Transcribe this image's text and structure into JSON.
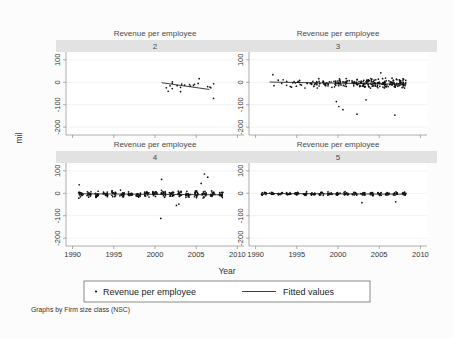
{
  "chart_data": {
    "type": "scatter",
    "title": "",
    "panel_title": "Revenue per employee",
    "xlabel": "Year",
    "ylabel": "mil",
    "note": "Graphs by Firm size class (NSC)",
    "xlim": [
      1989.2,
      2010.8
    ],
    "ylim": [
      -235,
      135
    ],
    "xticks": [
      1990,
      1995,
      2000,
      2005,
      2010
    ],
    "xticklabels": [
      "1990",
      "1995",
      "2000",
      "2005",
      "2010"
    ],
    "yticks": [
      100,
      0,
      -100,
      -200
    ],
    "yticklabels": [
      "100",
      "0",
      "-100",
      "-200"
    ],
    "grid": "horizontal",
    "legend_position": "bottom",
    "legend": [
      {
        "label": "Revenue per employee",
        "marker": "dot"
      },
      {
        "label": "Fitted values",
        "marker": "line"
      }
    ],
    "facet_variable": "Firm size class (NSC)",
    "panels": [
      {
        "id": "2",
        "strip_label": "2",
        "row": 0,
        "col": 0,
        "n_points": 19,
        "x_range": [
          2000.7,
          2007.2
        ],
        "y_center": -12,
        "y_spread": 22,
        "seed": 17,
        "fit": {
          "x0": 2000.8,
          "y0": -2,
          "x1": 2006.6,
          "y1": -32
        },
        "outliers": [
          {
            "x": 2003.1,
            "y": -42
          },
          {
            "x": 2007.1,
            "y": -72
          },
          {
            "x": 2001.6,
            "y": -40
          }
        ]
      },
      {
        "id": "3",
        "strip_label": "3",
        "row": 0,
        "col": 1,
        "n_points": 260,
        "x_range": [
          1991.6,
          2008.4
        ],
        "y_center": -4,
        "y_spread": 19,
        "seed": 43,
        "density_shift": 2001.5,
        "fit": {
          "x0": 1991.7,
          "y0": 1,
          "x1": 2008.3,
          "y1": -9
        },
        "outliers": [
          {
            "x": 2000.1,
            "y": -108
          },
          {
            "x": 2000.6,
            "y": -122
          },
          {
            "x": 2002.3,
            "y": -142
          },
          {
            "x": 2006.9,
            "y": -146
          },
          {
            "x": 1999.8,
            "y": -86
          },
          {
            "x": 2003.4,
            "y": -78
          },
          {
            "x": 1992.1,
            "y": 34
          },
          {
            "x": 2005.2,
            "y": 42
          }
        ]
      },
      {
        "id": "4",
        "strip_label": "4",
        "row": 1,
        "col": 0,
        "n_points": 300,
        "x_range": [
          1990.6,
          2008.3
        ],
        "y_center": -4,
        "y_spread": 14,
        "seed": 71,
        "banded": true,
        "fit": {
          "x0": 1990.7,
          "y0": -2,
          "x1": 2008.2,
          "y1": -7
        },
        "outliers": [
          {
            "x": 2000.8,
            "y": 62
          },
          {
            "x": 2006.0,
            "y": 86
          },
          {
            "x": 2006.4,
            "y": 72
          },
          {
            "x": 2005.6,
            "y": 44
          },
          {
            "x": 2000.7,
            "y": -112
          },
          {
            "x": 2002.6,
            "y": -54
          },
          {
            "x": 2002.9,
            "y": -48
          },
          {
            "x": 1990.8,
            "y": 38
          }
        ]
      },
      {
        "id": "5",
        "strip_label": "5",
        "row": 1,
        "col": 1,
        "n_points": 230,
        "x_range": [
          1991.0,
          2008.3
        ],
        "y_center": -2,
        "y_spread": 7,
        "seed": 95,
        "banded": true,
        "fit": {
          "x0": 1991.1,
          "y0": -1,
          "x1": 2008.2,
          "y1": -4
        },
        "outliers": [
          {
            "x": 2002.9,
            "y": -42
          },
          {
            "x": 2007.0,
            "y": -38
          }
        ]
      }
    ]
  },
  "colors": {
    "strip_bg": "#e2e2e2",
    "panel_bg": "#ffffff",
    "figure_bg": "#fcfcfc",
    "marker": "#101010",
    "fitline": "#1a1a1a",
    "gridline": "#ececed",
    "axis": "#8a8a8a"
  }
}
